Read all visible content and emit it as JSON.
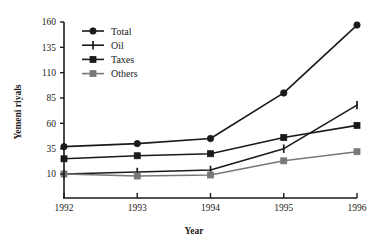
{
  "chart_data": {
    "type": "line",
    "title": "",
    "xlabel": "Year",
    "ylabel": "Yemeni riyals",
    "categories": [
      "1992",
      "1993",
      "1994",
      "1995",
      "1996"
    ],
    "x": [
      1992,
      1993,
      1994,
      1995,
      1996
    ],
    "xlim": [
      1992,
      1996
    ],
    "ylim": [
      10,
      160
    ],
    "yticks": [
      10,
      35,
      60,
      85,
      110,
      135,
      160
    ],
    "ytick_labels": [
      "10",
      "35",
      "60",
      "85",
      "110",
      "135",
      "160"
    ],
    "xtick_labels": [
      "1992",
      "1993",
      "1994",
      "1995",
      "1996"
    ],
    "grid": false,
    "legend_position": "upper-left",
    "series": [
      {
        "name": "Total",
        "marker": "circle",
        "color": "#1a1a1a",
        "values": [
          37,
          40,
          45,
          90,
          157
        ]
      },
      {
        "name": "Oil",
        "marker": "vertical-bar",
        "color": "#1a1a1a",
        "values": [
          10,
          12,
          14,
          35,
          78
        ]
      },
      {
        "name": "Taxes",
        "marker": "square",
        "color": "#1a1a1a",
        "values": [
          25,
          28,
          30,
          46,
          58
        ]
      },
      {
        "name": "Others",
        "marker": "square",
        "color": "#777777",
        "values": [
          10,
          8,
          9,
          23,
          32
        ]
      }
    ],
    "axis_color": "#1a1a1a"
  },
  "legend": {
    "entries": [
      {
        "label": "Total"
      },
      {
        "label": "Oil"
      },
      {
        "label": "Taxes"
      },
      {
        "label": "Others"
      }
    ]
  }
}
